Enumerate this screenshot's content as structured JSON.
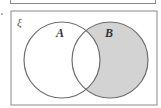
{
  "diagram": {
    "type": "venn",
    "universal_set_label": "ξ",
    "sets": [
      {
        "name": "A",
        "label": "A",
        "shaded": false
      },
      {
        "name": "B",
        "label": "B",
        "shaded": true
      }
    ],
    "shaded_region": "B only (B \\ A)",
    "colors": {
      "shade": "#d3d3d3",
      "stroke": "#6e6e6e",
      "frame": "#8a8a8a",
      "background": "#ffffff"
    }
  }
}
